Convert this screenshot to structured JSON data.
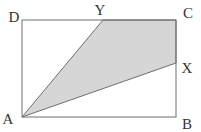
{
  "figure": {
    "background": "#ffffff",
    "shape": {
      "fill": "#d6d6d6",
      "stroke": "#6e6e6e",
      "rect": {
        "x": "22",
        "y": "20",
        "width": "154",
        "height": "97"
      },
      "shaded_points": "22,117 103,20 176,20 176,63"
    },
    "label_color": "#333333",
    "labels": [
      {
        "id": "D",
        "text": "D",
        "x": "14",
        "y": "22"
      },
      {
        "id": "Y",
        "text": "Y",
        "x": "100",
        "y": "15"
      },
      {
        "id": "C",
        "text": "C",
        "x": "188",
        "y": "18"
      },
      {
        "id": "X",
        "text": "X",
        "x": "187",
        "y": "73"
      },
      {
        "id": "A",
        "text": "A",
        "x": "8",
        "y": "124"
      },
      {
        "id": "B",
        "text": "B",
        "x": "187",
        "y": "129"
      }
    ]
  }
}
